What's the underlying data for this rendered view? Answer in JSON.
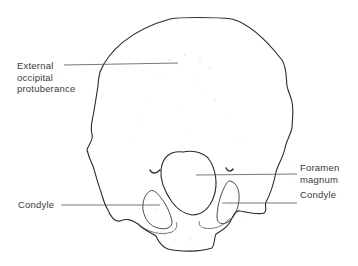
{
  "figure": {
    "labels": {
      "external_occipital_protuberance": {
        "lines": [
          "External",
          "occipital",
          "protuberance"
        ]
      },
      "foramen_magnum": {
        "lines": [
          "Foramen",
          "magnum"
        ]
      },
      "condyle_right": {
        "lines": [
          "Condyle"
        ]
      },
      "condyle_left": {
        "lines": [
          "Condyle"
        ]
      }
    },
    "colors": {
      "outline": "#2a2a2a",
      "leader_line": "#555555",
      "text": "#3a3a3a",
      "stipple": "#c8c8c8"
    }
  }
}
